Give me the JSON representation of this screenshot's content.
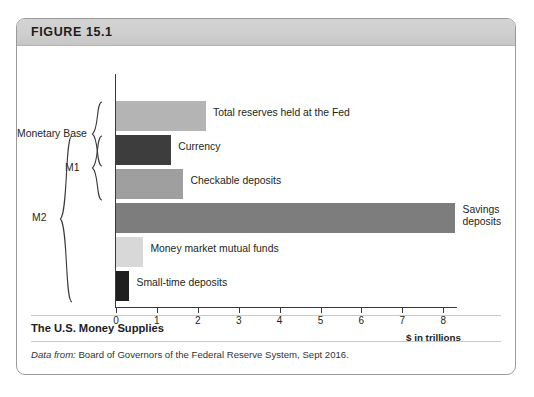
{
  "figure": {
    "header_title": "FIGURE 15.1",
    "caption_title": "The U.S. Money Supplies",
    "source_prefix": "Data from:",
    "source_text": " Board of Governors of the Federal Reserve System, Sept 2016."
  },
  "chart_data": {
    "type": "bar",
    "orientation": "horizontal",
    "title": "The U.S. Money Supplies",
    "xlabel": "$ in trillions",
    "ylabel": "",
    "xlim": [
      0,
      8.4
    ],
    "grid": false,
    "legend": "none",
    "categories": [
      "Total reserves held at the Fed",
      "Currency",
      "Checkable deposits",
      "Savings deposits",
      "Money market mutual funds",
      "Small-time deposits"
    ],
    "values": [
      2.2,
      1.35,
      1.65,
      8.3,
      0.67,
      0.33
    ],
    "colors": [
      "#b4b4b4",
      "#3d3d3d",
      "#9f9f9f",
      "#7d7d7d",
      "#d8d8d8",
      "#1f1f1f"
    ],
    "label_wrap": [
      false,
      false,
      false,
      true,
      false,
      false
    ],
    "axis_ticks": [
      {
        "value": 0,
        "label": "0"
      },
      {
        "value": 1,
        "label": "1"
      },
      {
        "value": 2,
        "label": "2"
      },
      {
        "value": 3,
        "label": "3"
      },
      {
        "value": 4,
        "label": "4"
      },
      {
        "value": 5,
        "label": "5"
      },
      {
        "value": 6,
        "label": "6"
      },
      {
        "value": 7,
        "label": "7"
      },
      {
        "value": 8,
        "label": "8"
      }
    ],
    "groups": [
      {
        "label": "Monetary Base",
        "members": [
          "Total reserves held at the Fed",
          "Currency"
        ]
      },
      {
        "label": "M1",
        "members": [
          "Currency",
          "Checkable deposits"
        ]
      },
      {
        "label": "M2",
        "members": [
          "Currency",
          "Checkable deposits",
          "Savings deposits",
          "Money market mutual funds",
          "Small-time deposits"
        ]
      }
    ],
    "annotations": [
      "$ in trillions"
    ]
  }
}
